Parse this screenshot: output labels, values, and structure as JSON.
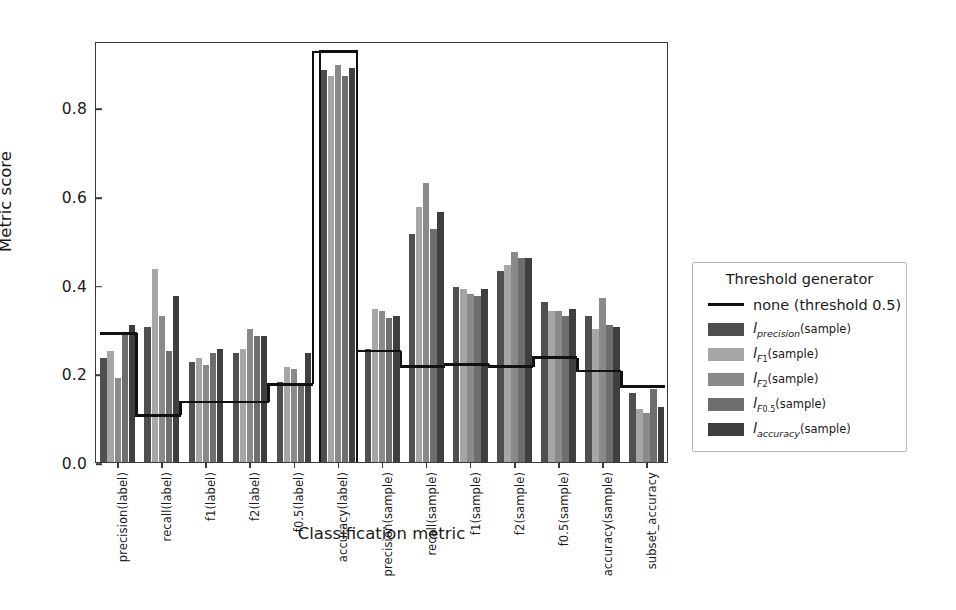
{
  "chart_data": {
    "type": "bar",
    "title": "",
    "xlabel": "Classification metric",
    "ylabel": "Metric score",
    "ylim": [
      0.0,
      0.95
    ],
    "yticks": [
      "0.0",
      "0.2",
      "0.4",
      "0.6",
      "0.8"
    ],
    "ytick_values": [
      0.0,
      0.2,
      0.4,
      0.6,
      0.8
    ],
    "grid": false,
    "legend_position": "right",
    "legend_title": "Threshold generator",
    "categories": [
      "precision(label)",
      "recall(label)",
      "f1(label)",
      "f2(label)",
      "f0.5(label)",
      "accuracy(label)",
      "precision(sample)",
      "recall(sample)",
      "f1(sample)",
      "f2(sample)",
      "f0.5(sample)",
      "accuracy(sample)",
      "subset_accuracy"
    ],
    "series": [
      {
        "name": "l_precision(sample)",
        "color": "#4f4f4f",
        "values": [
          0.235,
          0.305,
          0.225,
          0.245,
          0.18,
          0.885,
          0.255,
          0.515,
          0.395,
          0.43,
          0.36,
          0.33,
          0.155
        ]
      },
      {
        "name": "l_F1(sample)",
        "color": "#a6a6a6",
        "values": [
          0.25,
          0.435,
          0.235,
          0.255,
          0.215,
          0.87,
          0.345,
          0.575,
          0.39,
          0.445,
          0.34,
          0.3,
          0.12
        ]
      },
      {
        "name": "l_F2(sample)",
        "color": "#8a8a8a",
        "values": [
          0.19,
          0.33,
          0.22,
          0.3,
          0.21,
          0.895,
          0.34,
          0.63,
          0.38,
          0.475,
          0.34,
          0.37,
          0.11
        ]
      },
      {
        "name": "l_F0.5(sample)",
        "color": "#6e6e6e",
        "values": [
          0.29,
          0.25,
          0.245,
          0.285,
          0.175,
          0.87,
          0.325,
          0.525,
          0.375,
          0.46,
          0.33,
          0.31,
          0.165
        ]
      },
      {
        "name": "l_accuracy(sample)",
        "color": "#3f3f3f",
        "values": [
          0.31,
          0.375,
          0.255,
          0.285,
          0.245,
          0.89,
          0.33,
          0.565,
          0.39,
          0.46,
          0.345,
          0.305,
          0.125
        ]
      }
    ],
    "threshold_line": {
      "label": "none (threshold 0.5)",
      "color": "#111111",
      "values": [
        0.295,
        0.11,
        0.14,
        0.14,
        0.18,
        0.93,
        0.255,
        0.22,
        0.225,
        0.22,
        0.24,
        0.21,
        0.175
      ]
    },
    "highlight": {
      "category": "accuracy(label)",
      "top": 0.935,
      "bottom": 0.0
    }
  },
  "legend": {
    "title": "Threshold generator",
    "entries": [
      {
        "kind": "line",
        "label": "none (threshold 0.5)"
      },
      {
        "kind": "swatch",
        "label_main": "l",
        "label_sub": "precision",
        "label_tail": "(sample)"
      },
      {
        "kind": "swatch",
        "label_main": "l",
        "label_sub": "F",
        "label_sub2": "1",
        "label_tail": "(sample)"
      },
      {
        "kind": "swatch",
        "label_main": "l",
        "label_sub": "F",
        "label_sub2": "2",
        "label_tail": "(sample)"
      },
      {
        "kind": "swatch",
        "label_main": "l",
        "label_sub": "F",
        "label_sub2": "0.5",
        "label_tail": "(sample)"
      },
      {
        "kind": "swatch",
        "label_main": "l",
        "label_sub": "accuracy",
        "label_tail": "(sample)"
      }
    ]
  },
  "axes": {
    "ylabel": "Metric score",
    "xlabel": "Classification metric"
  }
}
